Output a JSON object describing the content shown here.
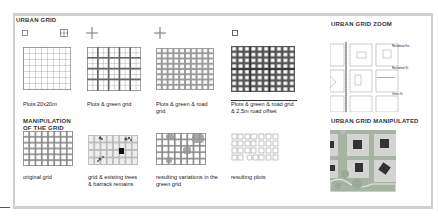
{
  "panel_left": {
    "title": "URBAN GRID",
    "steps": [
      {
        "caption": "Plots 20x20m",
        "icon": "square-icon"
      },
      {
        "caption": "Plots & green grid",
        "icon": "plus-icon"
      },
      {
        "caption": "Plots & green & road grid",
        "icon": "plus-icon"
      },
      {
        "caption": "Plots & green & road grid & 2.5m road offset",
        "icon": "square-icon"
      }
    ],
    "section2_title": "MANIPULATION OF THE GRID",
    "manip_steps": [
      {
        "caption": "original grid"
      },
      {
        "caption": "grid & existing trees & barrack remains"
      },
      {
        "caption": "resulting variations in the green grid"
      },
      {
        "caption": "resulting plots"
      }
    ]
  },
  "panel_right": {
    "zoom_title": "URBAN GRID ZOOM",
    "zoom_labels": [
      "Residential Ext.",
      "Residential St.",
      "Green St."
    ],
    "zoom_plot_label": "Residential Block",
    "manip_title": "URBAN GRID MANIPULATED"
  },
  "colors": {
    "frame": "#cfcfcf",
    "grid_line": "#555555",
    "green": "#9fb59b",
    "building": "#333333",
    "road": "#bfc9be"
  }
}
